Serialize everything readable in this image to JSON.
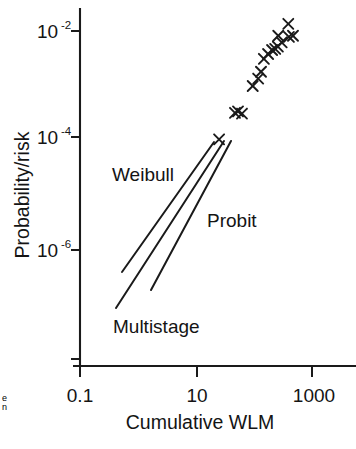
{
  "chart_data": {
    "type": "scatter",
    "title": "",
    "subtitle": "",
    "xlabel": "Cumulative WLM",
    "ylabel": "Probability/risk",
    "xscale": "log",
    "yscale": "log",
    "xlim": [
      0.1,
      1000
    ],
    "ylim": [
      1e-07,
      0.02
    ],
    "grid": false,
    "legend": "inline-annotations",
    "xticks": [
      {
        "value": 0.1,
        "label": "0.1"
      },
      {
        "value": 10,
        "label": "10"
      },
      {
        "value": 1000,
        "label": "1000"
      }
    ],
    "yticks": [
      {
        "value": 0.01,
        "label": "10",
        "exponent": "-2"
      },
      {
        "value": 0.0001,
        "label": "10",
        "exponent": "-4"
      },
      {
        "value": 1e-06,
        "label": "10",
        "exponent": "-6"
      }
    ],
    "series": [
      {
        "name": "Epidemiological data points",
        "type": "scatter",
        "marker": "x",
        "points": [
          {
            "x": 25,
            "y": 0.000105
          },
          {
            "x": 47,
            "y": 0.00032
          },
          {
            "x": 53,
            "y": 0.00034
          },
          {
            "x": 62,
            "y": 0.00031
          },
          {
            "x": 95,
            "y": 0.00099
          },
          {
            "x": 118,
            "y": 0.00135
          },
          {
            "x": 132,
            "y": 0.0018
          },
          {
            "x": 148,
            "y": 0.0031
          },
          {
            "x": 175,
            "y": 0.0038
          },
          {
            "x": 205,
            "y": 0.0045
          },
          {
            "x": 232,
            "y": 0.0047
          },
          {
            "x": 258,
            "y": 0.0052
          },
          {
            "x": 300,
            "y": 0.0062
          },
          {
            "x": 262,
            "y": 0.0082
          },
          {
            "x": 400,
            "y": 0.0078
          },
          {
            "x": 470,
            "y": 0.0082
          },
          {
            "x": 390,
            "y": 0.0135
          }
        ]
      },
      {
        "name": "Weibull",
        "type": "line",
        "label": "Weibull",
        "points": [
          {
            "x": 0.62,
            "y": 3.5e-07
          },
          {
            "x": 22,
            "y": 9.8e-05
          }
        ]
      },
      {
        "name": "Probit",
        "type": "line",
        "label": "Probit",
        "points": [
          {
            "x": 0.72,
            "y": 9e-08
          },
          {
            "x": 25,
            "y": 0.0001
          }
        ]
      },
      {
        "name": "Multistage",
        "type": "line",
        "label": "Multistage",
        "points": [
          {
            "x": 1.8,
            "y": 1.2e-07
          },
          {
            "x": 26,
            "y": 9.8e-05
          }
        ]
      }
    ],
    "annotations": [
      {
        "text": "Weibull",
        "x_px": 112,
        "y_px": 176
      },
      {
        "text": "Probit",
        "x_px": 207,
        "y_px": 222
      },
      {
        "text": "Multistage",
        "x_px": 113,
        "y_px": 328
      }
    ]
  },
  "axes": {
    "y_title": "Probability/risk",
    "x_title": "Cumulative WLM"
  },
  "edge": {
    "artifact_top": "e",
    "artifact_bottom": "n"
  }
}
